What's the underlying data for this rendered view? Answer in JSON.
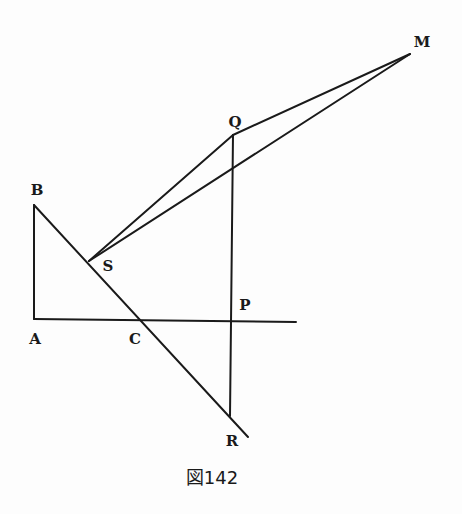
{
  "figure": {
    "caption": "図142",
    "points": {
      "A": {
        "label": "A",
        "x": 34,
        "y": 319,
        "lx": 35,
        "ly": 344
      },
      "B": {
        "label": "B",
        "x": 34,
        "y": 205,
        "lx": 37,
        "ly": 195
      },
      "C": {
        "label": "C",
        "x": 142,
        "y": 320,
        "lx": 135,
        "ly": 344
      },
      "P": {
        "label": "P",
        "x": 231,
        "y": 321,
        "lx": 245,
        "ly": 310
      },
      "Q": {
        "label": "Q",
        "x": 233,
        "y": 135,
        "lx": 235,
        "ly": 127
      },
      "R": {
        "label": "R",
        "x": 230,
        "y": 416,
        "lx": 232,
        "ly": 446
      },
      "S": {
        "label": "S",
        "x": 89,
        "y": 261,
        "lx": 108,
        "ly": 271
      },
      "M": {
        "label": "M",
        "x": 410,
        "y": 54,
        "lx": 422,
        "ly": 47
      }
    },
    "segments": [
      {
        "name": "segment-AB",
        "from": "A",
        "to": "B"
      },
      {
        "name": "segment-A-horizontal",
        "from": "A",
        "to": "H"
      },
      {
        "name": "segment-B-R-extended",
        "from": "B",
        "to": "Rext"
      },
      {
        "name": "segment-QR",
        "from": "Q",
        "to": "R"
      },
      {
        "name": "segment-SQ",
        "from": "S",
        "to": "Q"
      },
      {
        "name": "segment-QM",
        "from": "Q",
        "to": "M"
      },
      {
        "name": "segment-SM",
        "from": "S",
        "to": "M"
      }
    ]
  }
}
